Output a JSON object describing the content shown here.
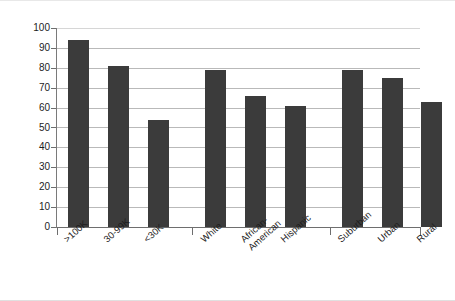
{
  "chart_data": {
    "type": "bar",
    "title": "",
    "xlabel": "",
    "ylabel": "% with Broadband Access",
    "ylim": [
      0,
      100
    ],
    "ytick_labels": [
      "100",
      "90",
      "80",
      "70",
      "60",
      "50",
      "40",
      "30",
      "20",
      "10",
      "0"
    ],
    "yticks": [
      100,
      90,
      80,
      70,
      60,
      50,
      40,
      30,
      20,
      10,
      0
    ],
    "grid": true,
    "legend": "none",
    "bar_color": "#3b3b3b",
    "categories": [
      ">100K",
      "30-99K",
      "<30K",
      "White",
      "African-American",
      "Hispanic",
      "Suburban",
      "Urban",
      "Rural"
    ],
    "category_lines": [
      [
        ">100K"
      ],
      [
        "30-99K"
      ],
      [
        "<30K"
      ],
      [
        "White"
      ],
      [
        "African-",
        "American"
      ],
      [
        "Hispanic"
      ],
      [
        "Suburban"
      ],
      [
        "Urban"
      ],
      [
        "Rural"
      ]
    ],
    "values": [
      94,
      81,
      54,
      79,
      66,
      61,
      79,
      75,
      63
    ],
    "groups": [
      {
        "name": "Income",
        "categories": [
          ">100K",
          "30-99K",
          "<30K"
        ]
      },
      {
        "name": "Race/Ethnicity",
        "categories": [
          "White",
          "African-American",
          "Hispanic"
        ]
      },
      {
        "name": "Geography",
        "categories": [
          "Suburban",
          "Urban",
          "Rural"
        ]
      }
    ]
  }
}
